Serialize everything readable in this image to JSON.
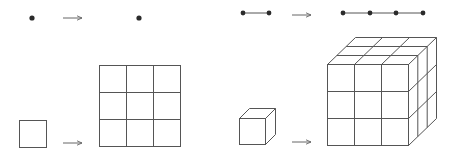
{
  "diagram": {
    "title": "",
    "colors": {
      "line": "#555555",
      "dot": "#2b2b2b",
      "arrow": "#666666",
      "background": "#ffffff"
    },
    "panels": [
      {
        "id": "dim0",
        "from": "point",
        "to": "point",
        "scale": 3,
        "copies": 1
      },
      {
        "id": "dim1",
        "from": "segment",
        "to": "segment of 3 parts",
        "scale": 3,
        "copies": 3
      },
      {
        "id": "dim2",
        "from": "square",
        "to": "3x3 grid of squares",
        "scale": 3,
        "copies": 9
      },
      {
        "id": "dim3",
        "from": "cube",
        "to": "3x3x3 cube",
        "scale": 3,
        "copies": 27
      }
    ],
    "arrow_icon": "right-arrow-icon"
  }
}
